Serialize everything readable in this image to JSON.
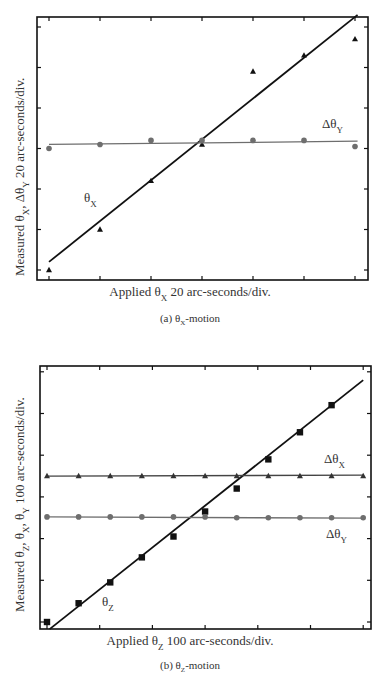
{
  "chart_data": [
    {
      "id": "a",
      "type": "scatter",
      "caption": "(a) θX-motion",
      "caption_parts": {
        "pre": "(a) θ",
        "sub": "X",
        "post": "-motion"
      },
      "xlabel": "Applied θX 20 arc-seconds/div.",
      "xlabel_parts": {
        "pre": "Applied θ",
        "sub": "X",
        "post": " 20 arc-seconds/div."
      },
      "ylabel": "Measured θX, ΔθY 20 arc-seconds/div.",
      "ylabel_parts": {
        "pre": "Measured θ",
        "sub1": "X",
        "mid": ", Δθ",
        "sub2": "Y",
        "post": " 20 arc-seconds/div."
      },
      "x_unit": "divisions (20 arc-seconds/div)",
      "y_unit": "divisions (20 arc-seconds/div)",
      "xlim": [
        -0.25,
        6.25
      ],
      "ylim": [
        -0.25,
        6.25
      ],
      "tick_labels_shown": false,
      "grid": false,
      "legend": "inline labels",
      "series": [
        {
          "name": "θX",
          "label_parts": {
            "pre": "θ",
            "sub": "X"
          },
          "marker": "triangle",
          "color": "#111111",
          "x": [
            0,
            1,
            2,
            3,
            4,
            5,
            6
          ],
          "y": [
            0.0,
            1.0,
            2.2,
            3.1,
            4.9,
            5.3,
            5.7
          ],
          "fit": {
            "x": [
              0,
              6.05
            ],
            "y": [
              0.2,
              6.3
            ]
          },
          "fit_color": "#111111"
        },
        {
          "name": "ΔθY",
          "label_parts": {
            "pre": "Δθ",
            "sub": "Y"
          },
          "marker": "circle",
          "color": "#6e6e6e",
          "x": [
            0,
            1,
            2,
            3,
            4,
            5,
            6
          ],
          "y": [
            3.0,
            3.1,
            3.2,
            3.2,
            3.2,
            3.2,
            3.05
          ],
          "fit": {
            "x": [
              0,
              6.05
            ],
            "y": [
              3.1,
              3.18
            ]
          },
          "fit_color": "#6e6e6e"
        }
      ]
    },
    {
      "id": "b",
      "type": "scatter",
      "caption": "(b) θZ-motion",
      "caption_parts": {
        "pre": "(b) θ",
        "sub": "Z",
        "post": "-motion"
      },
      "xlabel": "Applied θZ 100 arc-seconds/div.",
      "xlabel_parts": {
        "pre": "Applied θ",
        "sub": "Z",
        "post": " 100 arc-seconds/div."
      },
      "ylabel": "Measured θZ, θX, θY 100 arc-seconds/div.",
      "ylabel_parts": {
        "pre": "Measured θ",
        "sub1": "Z",
        "mid": ", θ",
        "sub2": "X",
        "mid2": ", θ",
        "sub3": "Y",
        "post": " 100 arc-seconds/div."
      },
      "x_unit": "divisions (100 arc-seconds/div)",
      "y_unit": "divisions (100 arc-seconds/div)",
      "xlim": [
        -0.15,
        6.15
      ],
      "ylim": [
        -0.17,
        6.2
      ],
      "tick_labels_shown": false,
      "grid": false,
      "legend": "inline labels",
      "series": [
        {
          "name": "θZ",
          "label_parts": {
            "pre": "θ",
            "sub": "Z"
          },
          "marker": "square",
          "color": "#111111",
          "x": [
            0,
            0.6,
            1.2,
            1.8,
            2.4,
            3.0,
            3.6,
            4.2,
            4.8,
            5.4
          ],
          "y": [
            0.0,
            0.45,
            0.95,
            1.55,
            2.05,
            2.65,
            3.2,
            3.9,
            4.55,
            5.2
          ],
          "fit": {
            "x": [
              0.05,
              6.0
            ],
            "y": [
              -0.17,
              5.8
            ]
          },
          "fit_color": "#111111"
        },
        {
          "name": "ΔθX",
          "label_parts": {
            "pre": "Δθ",
            "sub": "X"
          },
          "marker": "triangle",
          "color": "#333333",
          "x": [
            0,
            0.6,
            1.2,
            1.8,
            2.4,
            3.0,
            3.6,
            4.2,
            4.8,
            5.4,
            6.0
          ],
          "y": [
            3.5,
            3.5,
            3.5,
            3.5,
            3.5,
            3.5,
            3.5,
            3.5,
            3.5,
            3.5,
            3.5
          ],
          "fit": {
            "x": [
              0,
              6.0
            ],
            "y": [
              3.5,
              3.52
            ]
          },
          "fit_color": "#444444"
        },
        {
          "name": "ΔθY",
          "label_parts": {
            "pre": "Δθ",
            "sub": "Y"
          },
          "marker": "circle",
          "color": "#6e6e6e",
          "x": [
            0,
            0.6,
            1.2,
            1.8,
            2.4,
            3.0,
            3.6,
            4.2,
            4.8,
            5.4,
            6.0
          ],
          "y": [
            2.52,
            2.52,
            2.52,
            2.52,
            2.52,
            2.52,
            2.5,
            2.5,
            2.5,
            2.5,
            2.5
          ],
          "fit": {
            "x": [
              0,
              6.0
            ],
            "y": [
              2.52,
              2.49
            ]
          },
          "fit_color": "#6e6e6e"
        }
      ]
    }
  ]
}
